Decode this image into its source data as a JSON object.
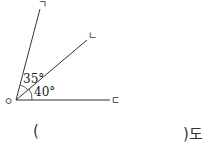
{
  "diagram": {
    "vertex_label": "ㅇ",
    "rays": [
      {
        "label": "ㄱ"
      },
      {
        "label": "ㄴ"
      },
      {
        "label": "ㄷ"
      }
    ],
    "angles": [
      {
        "between": "ㄱ-ㄴ",
        "label": "35°"
      },
      {
        "between": "ㄴ-ㄷ",
        "label": "40°"
      }
    ]
  },
  "answer": {
    "open": "(",
    "value": "",
    "close_with_unit": ")도"
  }
}
